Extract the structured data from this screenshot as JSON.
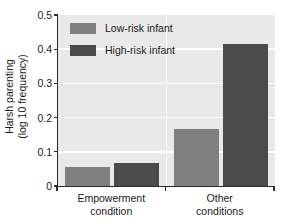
{
  "chart_data": {
    "type": "bar",
    "title": "",
    "xlabel": "",
    "ylabel": "Harsh parenting\n(log 10 frequency)",
    "ylabel_line1": "Harsh parenting",
    "ylabel_line2": "(log 10 frequency)",
    "ylim": [
      0,
      0.5
    ],
    "ytick_labels": [
      "0.5",
      "0.4",
      "0.3",
      "0.2",
      "0.1",
      "0"
    ],
    "ytick_values": [
      0.5,
      0.4,
      0.3,
      0.2,
      0.1,
      0
    ],
    "grid": "horizontal-white-gridlines-plus-group-separator",
    "legend_position": "upper-left-inside",
    "categories": [
      "Empowerment condition",
      "Other conditions"
    ],
    "category_lines": [
      [
        "Empowerment",
        "condition"
      ],
      [
        "Other",
        "conditions"
      ]
    ],
    "series": [
      {
        "name": "Low-risk infant",
        "color": "#7f7f7f",
        "values": [
          0.055,
          0.168
        ]
      },
      {
        "name": "High-risk infant",
        "color": "#4b4b4b",
        "values": [
          0.068,
          0.416
        ]
      }
    ]
  },
  "legend": {
    "items": [
      {
        "label": "Low-risk infant",
        "color": "#7f7f7f"
      },
      {
        "label": "High-risk infant",
        "color": "#4b4b4b"
      }
    ]
  },
  "axes": {
    "y_title_line1": "Harsh parenting",
    "y_title_line2": "(log 10 frequency)",
    "y_ticks": [
      {
        "label": "0.5",
        "value": 0.5
      },
      {
        "label": "0.4",
        "value": 0.4
      },
      {
        "label": "0.3",
        "value": 0.3
      },
      {
        "label": "0.2",
        "value": 0.2
      },
      {
        "label": "0.1",
        "value": 0.1
      },
      {
        "label": "0",
        "value": 0.0
      }
    ],
    "x_categories": [
      {
        "line1": "Empowerment",
        "line2": "condition"
      },
      {
        "line1": "Other",
        "line2": "conditions"
      }
    ]
  },
  "colors": {
    "plot_background": "#e9e9e9",
    "gridline": "#ffffff",
    "axis": "#2a2a2a",
    "low_risk": "#7f7f7f",
    "high_risk": "#4b4b4b",
    "text": "#1a1a1a"
  }
}
